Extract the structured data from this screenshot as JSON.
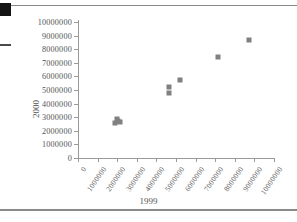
{
  "figure": {
    "x_axis_title": "1999",
    "y_axis_title": "2000",
    "marker_color": "#808080",
    "axis_color": "#9a9a9a",
    "rule_color": "#8a8a8a"
  },
  "chart_data": {
    "type": "scatter",
    "title": "",
    "xlabel": "1999",
    "ylabel": "2000",
    "xlim": [
      0,
      10000000
    ],
    "ylim": [
      0,
      10000000
    ],
    "grid": false,
    "legend": null,
    "x_ticks": [
      0,
      1000000,
      2000000,
      3000000,
      4000000,
      5000000,
      6000000,
      7000000,
      8000000,
      9000000,
      10000000
    ],
    "y_ticks": [
      0,
      1000000,
      2000000,
      3000000,
      4000000,
      5000000,
      6000000,
      7000000,
      8000000,
      9000000,
      10000000
    ],
    "x_tick_labels": [
      "0",
      "1000000",
      "2000000",
      "3000000",
      "4000000",
      "5000000",
      "6000000",
      "7000000",
      "8000000",
      "9000000",
      "10000000"
    ],
    "y_tick_labels": [
      "0",
      "1000000",
      "2000000",
      "3000000",
      "4000000",
      "5000000",
      "6000000",
      "7000000",
      "8000000",
      "9000000",
      "10000000"
    ],
    "x_tick_rotation": -55,
    "points": [
      {
        "x": 1900000,
        "y": 2600000
      },
      {
        "x": 2000000,
        "y": 2850000
      },
      {
        "x": 2050000,
        "y": 2700000
      },
      {
        "x": 2150000,
        "y": 2680000
      },
      {
        "x": 4650000,
        "y": 5200000
      },
      {
        "x": 4650000,
        "y": 4800000
      },
      {
        "x": 5200000,
        "y": 5750000
      },
      {
        "x": 7150000,
        "y": 7400000
      },
      {
        "x": 8700000,
        "y": 8700000
      }
    ]
  }
}
